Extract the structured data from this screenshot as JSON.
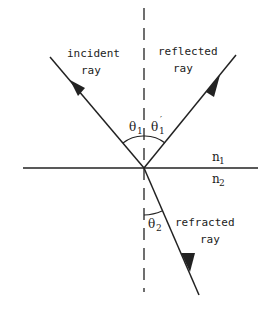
{
  "diagram": {
    "labels": {
      "incident_line1": "incident",
      "incident_line2": "ray",
      "reflected_line1": "reflected",
      "reflected_line2": "ray",
      "refracted_line1": "refracted",
      "refracted_line2": "ray",
      "theta": "θ",
      "theta1_sub": "1",
      "theta1p_sub": "1",
      "theta1p_prime": "′",
      "theta2_sub": "2",
      "n": "n",
      "n1_sub": "1",
      "n2_sub": "2"
    },
    "colors": {
      "ink": "#222222",
      "background": "#ffffff"
    }
  }
}
